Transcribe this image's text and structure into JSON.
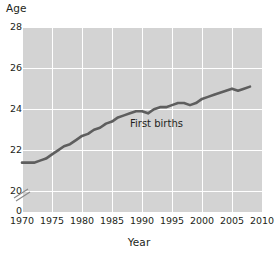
{
  "chart_data": {
    "type": "line",
    "title": "",
    "xlabel": "Year",
    "ylabel": "Age",
    "xlim": [
      1970,
      2010
    ],
    "ylim": [
      19.0,
      28.0
    ],
    "grid": true,
    "legend_position": "inline-annotation",
    "y_axis_break": true,
    "y_axis_break_note": "axis broken between 0 and 20",
    "xticks": [
      1970,
      1975,
      1980,
      1985,
      1990,
      1995,
      2000,
      2005,
      2010
    ],
    "xtick_labels": [
      "1970",
      "1975",
      "1980",
      "1985",
      "1990",
      "1995",
      "2000",
      "2005",
      "2010"
    ],
    "yticks": [
      20,
      22,
      24,
      26,
      28
    ],
    "ytick_labels": [
      "20",
      "22",
      "24",
      "26",
      "28"
    ],
    "y_extra_tick": {
      "value": 0,
      "label": "0"
    },
    "series": [
      {
        "name": "First births",
        "color": "#5e5e5e",
        "annotation": "First births",
        "x": [
          1970,
          1971,
          1972,
          1973,
          1974,
          1975,
          1976,
          1977,
          1978,
          1979,
          1980,
          1981,
          1982,
          1983,
          1984,
          1985,
          1986,
          1987,
          1988,
          1989,
          1990,
          1991,
          1992,
          1993,
          1994,
          1995,
          1996,
          1997,
          1998,
          1999,
          2000,
          2001,
          2002,
          2003,
          2004,
          2005,
          2006,
          2007,
          2008
        ],
        "values": [
          21.4,
          21.4,
          21.4,
          21.5,
          21.6,
          21.8,
          22.0,
          22.2,
          22.3,
          22.5,
          22.7,
          22.8,
          23.0,
          23.1,
          23.3,
          23.4,
          23.6,
          23.7,
          23.8,
          23.9,
          23.9,
          23.8,
          24.0,
          24.1,
          24.1,
          24.2,
          24.3,
          24.3,
          24.2,
          24.3,
          24.5,
          24.6,
          24.7,
          24.8,
          24.9,
          25.0,
          24.9,
          25.0,
          25.1
        ]
      }
    ]
  },
  "axes": {
    "y_title": "Age",
    "x_title": "Year"
  },
  "icons": {
    "axis_break": "axis-break-slashes-icon"
  }
}
